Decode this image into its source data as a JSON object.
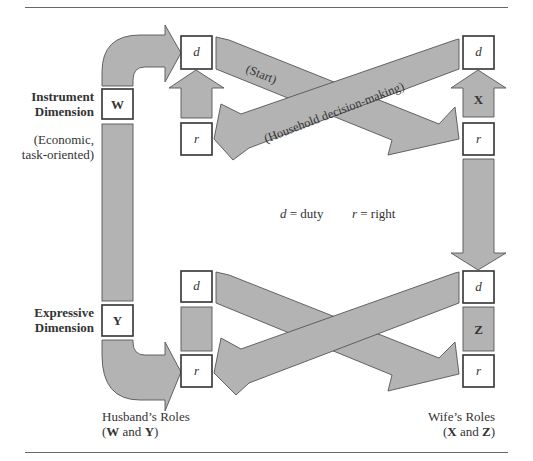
{
  "diagram": {
    "left_labels": {
      "instrument_line1": "Instrument",
      "instrument_line2": "Dimension",
      "instrument_note_line1": "(Economic,",
      "instrument_note_line2": "task-oriented)",
      "expressive_line1": "Expressive",
      "expressive_line2": "Dimension"
    },
    "role_boxes": {
      "W": "W",
      "Y": "Y",
      "X": "X",
      "Z": "Z",
      "duty": "d",
      "right": "r"
    },
    "arrow_labels": {
      "start": "(Start)",
      "household": "(Household decision-making)"
    },
    "legend": {
      "duty_symbol": "d",
      "duty_text": " = duty",
      "right_symbol": "r",
      "right_text": " = right"
    },
    "footer": {
      "husband_line1": "Husband’s Roles",
      "husband_open": "(",
      "husband_W": "W",
      "husband_and": " and ",
      "husband_Y": "Y",
      "husband_close": ")",
      "wife_line1": "Wife’s Roles",
      "wife_open": "(",
      "wife_X": "X",
      "wife_and": " and ",
      "wife_Z": "Z",
      "wife_close": ")"
    },
    "colors": {
      "arrow_fill": "#b3b3b3",
      "arrow_stroke": "#555555",
      "box_stroke": "#333333",
      "rule": "#666666"
    }
  }
}
